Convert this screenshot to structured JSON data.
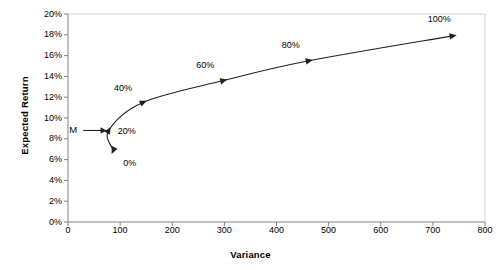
{
  "chart_data": {
    "type": "line",
    "title": "",
    "xlabel": "Variance",
    "ylabel": "Expected Return",
    "xlim": [
      0,
      800
    ],
    "ylim": [
      0,
      0.2
    ],
    "grid": false,
    "legend": "none",
    "x_ticks": [
      "0",
      "100",
      "200",
      "300",
      "400",
      "500",
      "600",
      "700",
      "800"
    ],
    "x_tick_values": [
      0,
      100,
      200,
      300,
      400,
      500,
      600,
      700,
      800
    ],
    "y_ticks": [
      "0%",
      "2%",
      "4%",
      "6%",
      "8%",
      "10%",
      "12%",
      "14%",
      "16%",
      "18%",
      "20%"
    ],
    "y_tick_values": [
      0,
      2,
      4,
      6,
      8,
      10,
      12,
      14,
      16,
      18,
      20
    ],
    "series": [
      {
        "name": "Portfolio frontier",
        "marker": "triangle",
        "points": [
          {
            "label": "0%",
            "x": 87,
            "y": 6.9,
            "label_dx": 10,
            "label_dy": 14
          },
          {
            "label": "20%",
            "x": 78,
            "y": 8.8,
            "label_dx": 9,
            "label_dy": 2
          },
          {
            "label": "40%",
            "x": 144,
            "y": 11.5,
            "label_dx": -29,
            "label_dy": -13
          },
          {
            "label": "60%",
            "x": 298,
            "y": 13.6,
            "label_dx": -27,
            "label_dy": -15
          },
          {
            "label": "80%",
            "x": 462,
            "y": 15.5,
            "label_dx": -27,
            "label_dy": -15
          },
          {
            "label": "100%",
            "x": 738,
            "y": 17.9,
            "label_dx": -25,
            "label_dy": -16
          }
        ]
      }
    ],
    "annotations": [
      {
        "text": "M",
        "meaning": "minimum-variance-portfolio-pointer",
        "x": 10,
        "y": 8.8,
        "arrow_to_x": 74,
        "arrow_to_y": 8.8
      }
    ],
    "colors": {
      "line": "#231f20",
      "marker": "#231f20",
      "axis": "#808080",
      "plot_border": "#d0d0d0",
      "text": "#000000",
      "background": "#ffffff"
    }
  }
}
